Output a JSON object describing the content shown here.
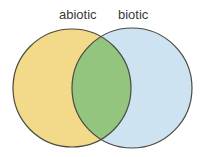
{
  "diagram": {
    "type": "venn",
    "sets": [
      {
        "id": "abiotic",
        "label": "abiotic",
        "color": "#f3d98a"
      },
      {
        "id": "biotic",
        "label": "biotic",
        "color": "#cde3f2"
      }
    ],
    "intersection": {
      "color": "#94c57f"
    },
    "outline_color": "#4a4a40"
  }
}
